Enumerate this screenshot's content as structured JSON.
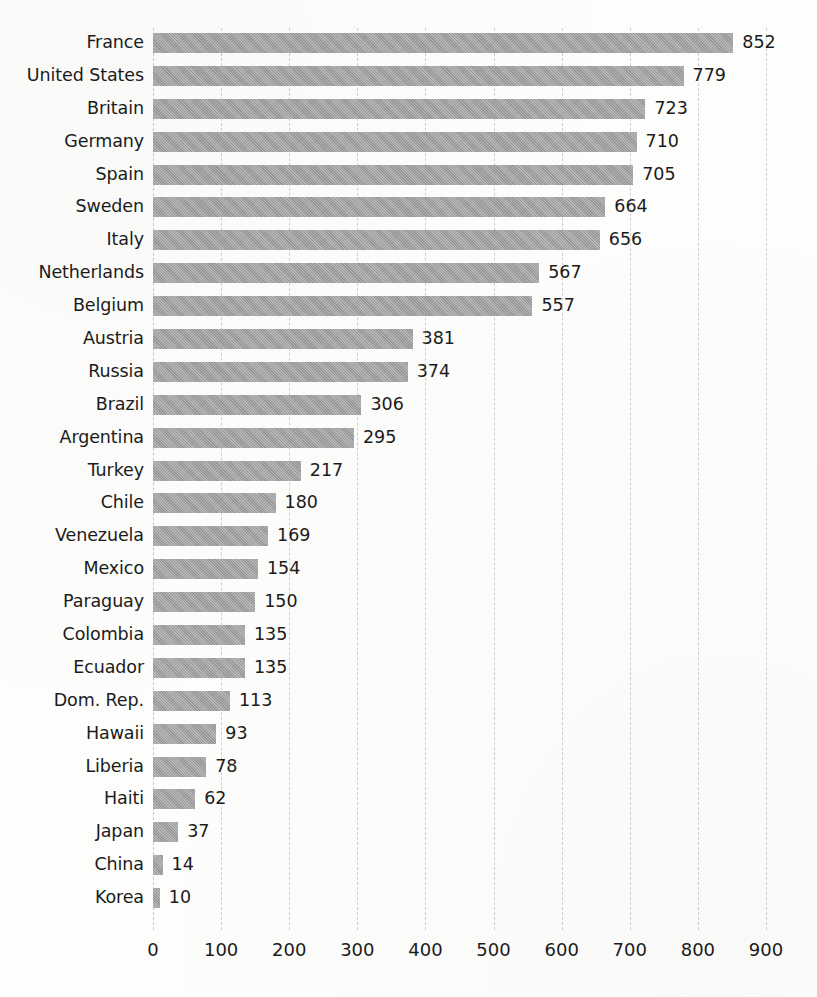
{
  "chart_data": {
    "type": "bar",
    "orientation": "horizontal",
    "title": "",
    "subtitle": "",
    "xlabel": "",
    "ylabel": "",
    "xlim": [
      0,
      900
    ],
    "xticks": [
      0,
      100,
      200,
      300,
      400,
      500,
      600,
      700,
      800,
      900
    ],
    "xtick_labels": [
      "0",
      "100",
      "200",
      "300",
      "400",
      "500",
      "600",
      "700",
      "800",
      "900"
    ],
    "grid": "vertical-dashed",
    "legend": "none",
    "data_labels": true,
    "bar_color": "#9c9c9c",
    "text_color": "#1b1b1b",
    "gridline_color": "#cfcfcf",
    "background_color": "#fdfdfc",
    "categories": [
      "France",
      "United States",
      "Britain",
      "Germany",
      "Spain",
      "Sweden",
      "Italy",
      "Netherlands",
      "Belgium",
      "Austria",
      "Russia",
      "Brazil",
      "Argentina",
      "Turkey",
      "Chile",
      "Venezuela",
      "Mexico",
      "Paraguay",
      "Colombia",
      "Ecuador",
      "Dom. Rep.",
      "Hawaii",
      "Liberia",
      "Haiti",
      "Japan",
      "China",
      "Korea"
    ],
    "values": [
      852,
      779,
      723,
      710,
      705,
      664,
      656,
      567,
      557,
      381,
      374,
      306,
      295,
      217,
      180,
      169,
      154,
      150,
      135,
      135,
      113,
      93,
      78,
      62,
      37,
      14,
      10
    ],
    "value_labels": [
      "852",
      "779",
      "723",
      "710",
      "705",
      "664",
      "656",
      "567",
      "557",
      "381",
      "374",
      "306",
      "295",
      "217",
      "180",
      "169",
      "154",
      "150",
      "135",
      "135",
      "113",
      "93",
      "78",
      "62",
      "37",
      "14",
      "10"
    ]
  }
}
